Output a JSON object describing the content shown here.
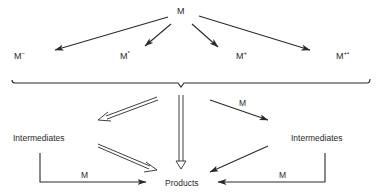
{
  "diagram": {
    "colors": {
      "ink": "#2a2a2a",
      "background": "#ffffff"
    },
    "source": {
      "label": "M"
    },
    "species": [
      {
        "base": "M",
        "sup": "−"
      },
      {
        "base": "M",
        "sup": "*"
      },
      {
        "base": "M",
        "sup": "+"
      },
      {
        "base": "M",
        "sup": "+•"
      }
    ],
    "left_intermediates": {
      "label": "Intermediates"
    },
    "right_intermediates": {
      "label": "Intermediates"
    },
    "products": {
      "label": "Products"
    },
    "edge_labels": {
      "to_right_intermediates": "M",
      "left_intermediates_to_products": "M",
      "right_intermediates_to_products": "M"
    }
  }
}
